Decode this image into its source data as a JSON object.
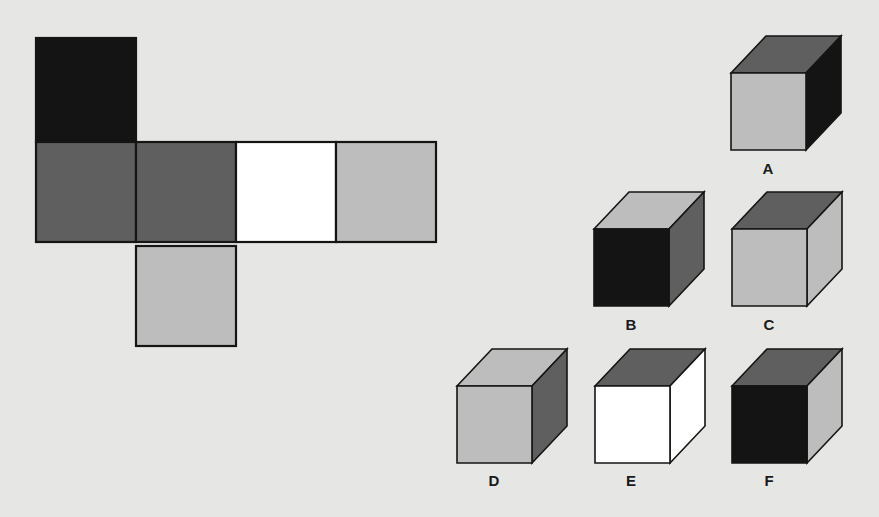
{
  "colors": {
    "black": "#141414",
    "dark": "#5f5f5f",
    "white": "#ffffff",
    "light": "#bdbdbd",
    "background": "#e6e6e4"
  },
  "net": {
    "square_size": 100,
    "faces": [
      {
        "id": "top-flap",
        "col": 0,
        "row": 0,
        "color": "black"
      },
      {
        "id": "row-1",
        "col": 0,
        "row": 1,
        "color": "dark"
      },
      {
        "id": "row-2",
        "col": 1,
        "row": 1,
        "color": "dark"
      },
      {
        "id": "row-3",
        "col": 2,
        "row": 1,
        "color": "white"
      },
      {
        "id": "row-4",
        "col": 3,
        "row": 1,
        "color": "light"
      },
      {
        "id": "bottom-flap",
        "col": 1,
        "row": 2,
        "color": "light"
      }
    ]
  },
  "options": [
    {
      "label": "A",
      "front": "light",
      "top": "dark",
      "side": "black"
    },
    {
      "label": "B",
      "front": "black",
      "top": "light",
      "side": "dark"
    },
    {
      "label": "C",
      "front": "light",
      "top": "dark",
      "side": "light"
    },
    {
      "label": "D",
      "front": "light",
      "top": "light",
      "side": "dark"
    },
    {
      "label": "E",
      "front": "white",
      "top": "dark",
      "side": "white"
    },
    {
      "label": "F",
      "front": "black",
      "top": "dark",
      "side": "light"
    }
  ]
}
